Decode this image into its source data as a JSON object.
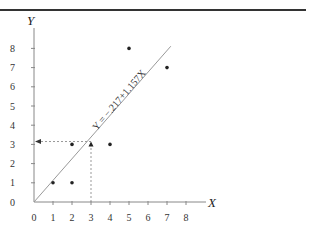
{
  "chart_data": {
    "type": "scatter",
    "title": "",
    "xlabel": "X",
    "ylabel": "Y",
    "xlim": [
      0,
      8
    ],
    "ylim": [
      0,
      8
    ],
    "x_ticks": [
      "0",
      "1",
      "2",
      "3",
      "4",
      "5",
      "6",
      "7",
      "8"
    ],
    "y_ticks": [
      "0",
      "1",
      "2",
      "3",
      "4",
      "5",
      "6",
      "7",
      "8"
    ],
    "grid": false,
    "series": [
      {
        "name": "observations",
        "marker": "dot",
        "points": [
          [
            1,
            1
          ],
          [
            2,
            1
          ],
          [
            2,
            3
          ],
          [
            4,
            3
          ],
          [
            5,
            8
          ],
          [
            7,
            7
          ]
        ]
      },
      {
        "name": "highlighted point",
        "marker": "triangle",
        "points": [
          [
            3,
            3
          ]
        ]
      },
      {
        "name": "regression line",
        "type": "line",
        "equation": "Y = −.217+1.157X",
        "intercept": -0.217,
        "slope": 1.157,
        "x_range": [
          0,
          7.2
        ]
      }
    ],
    "annotations": [
      {
        "type": "dashed-guide",
        "from": [
          3,
          0
        ],
        "to": [
          3,
          3
        ],
        "description": "vertical dashed line from x=3 up to the line"
      },
      {
        "type": "dashed-arrow",
        "from": [
          3,
          3.1
        ],
        "to": [
          0,
          3.1
        ],
        "description": "horizontal dashed arrow to the Y axis at about 3.2"
      }
    ]
  }
}
